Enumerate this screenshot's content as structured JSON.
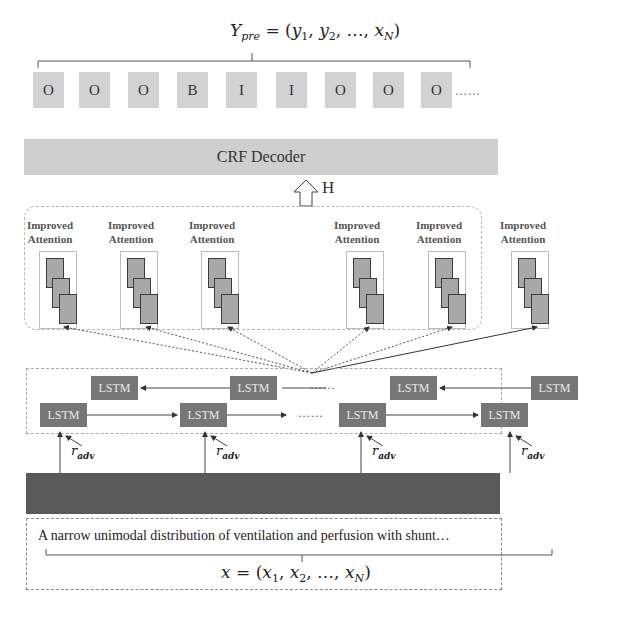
{
  "output": {
    "formula": "Y_pre = (y1, y2, …, xN)",
    "formula_parts": {
      "lhs": "Y",
      "lhs_sub": "pre",
      "eq": " = (",
      "y1": "y",
      "s1": "1",
      "sep1": ", ",
      "y2": "y",
      "s2": "2",
      "mid": ", …, ",
      "xn": "x",
      "sn": "N",
      "close": ")"
    },
    "tags": [
      "O",
      "O",
      "O",
      "B",
      "I",
      "I",
      "O",
      "O",
      "O"
    ],
    "ellipsis": "……"
  },
  "crf": {
    "label": "CRF Decoder"
  },
  "hidden": {
    "label": "H"
  },
  "attention": {
    "label_line1": "Improved",
    "label_line2": "Attention",
    "count": 6
  },
  "bilstm": {
    "cell_label": "LSTM",
    "backward_cells": [
      "LSTM",
      "LSTM",
      "LSTM",
      "LSTM"
    ],
    "forward_cells": [
      "LSTM",
      "LSTM",
      "LSTM",
      "LSTM"
    ],
    "ellipsis": "……"
  },
  "perturbation": {
    "symbol": "r",
    "sub": "adv",
    "count": 4
  },
  "input": {
    "sentence": "A narrow unimodal distribution of ventilation and perfusion with shunt…",
    "formula_parts": {
      "lhs": "x",
      "eq": " = (",
      "x1": "x",
      "s1": "1",
      "sep1": ", ",
      "x2": "x",
      "s2": "2",
      "mid": ", …, ",
      "xn": "x",
      "sn": "N",
      "close": ")"
    }
  },
  "colors": {
    "tag_fill": "#d2d2d2",
    "crf_fill": "#cfcfcf",
    "lstm_fill": "#767676",
    "embedding_fill": "#595959",
    "attention_sheet_fill": "#a8a8a8"
  }
}
